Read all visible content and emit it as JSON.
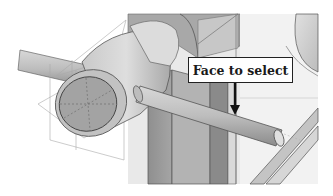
{
  "callout": {
    "label": "Face to select"
  },
  "scene": {
    "description": "CAD 3D model view: shaft with cylindrical boss passing through a plate, with datum planes shown",
    "icons": [
      "shaft-model",
      "cylinder-boss",
      "datum-plane",
      "selection-arrow"
    ]
  }
}
